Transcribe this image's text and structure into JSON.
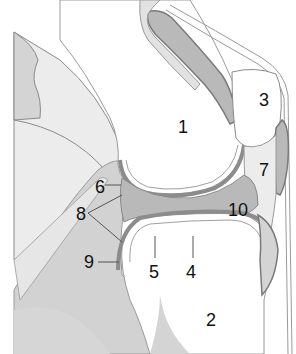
{
  "diagram": {
    "colors": {
      "background": "#ffffff",
      "soft_tissue_light": "#ececec",
      "soft_tissue_mid": "#d4d4d4",
      "muscle_dark": "#b9b9b9",
      "outline": "#7a7a7a",
      "cartilage_line": "#8c8c8c",
      "label_text": "#111111"
    },
    "labels": [
      {
        "id": "1",
        "text": "1",
        "x": 178,
        "y": 118
      },
      {
        "id": "2",
        "text": "2",
        "x": 206,
        "y": 311
      },
      {
        "id": "3",
        "text": "3",
        "x": 259,
        "y": 91
      },
      {
        "id": "4",
        "text": "4",
        "x": 186,
        "y": 263
      },
      {
        "id": "5",
        "text": "5",
        "x": 149,
        "y": 263
      },
      {
        "id": "6",
        "text": "6",
        "x": 95,
        "y": 182
      },
      {
        "id": "7",
        "text": "7",
        "x": 259,
        "y": 161
      },
      {
        "id": "8",
        "text": "8",
        "x": 76,
        "y": 211
      },
      {
        "id": "9",
        "text": "9",
        "x": 84,
        "y": 254
      },
      {
        "id": "10",
        "text": "10",
        "x": 228,
        "y": 203
      }
    ]
  }
}
